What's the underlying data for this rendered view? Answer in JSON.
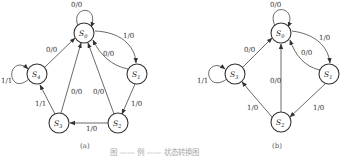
{
  "figure": {
    "caption": "图 ——  例 —— 状态转换图",
    "subfigures": [
      {
        "id": "a",
        "label": "(a)",
        "states": [
          {
            "name": "S",
            "sub": "0",
            "x": 84,
            "y": 33
          },
          {
            "name": "S",
            "sub": "1",
            "x": 137,
            "y": 74
          },
          {
            "name": "S",
            "sub": "2",
            "x": 118,
            "y": 123
          },
          {
            "name": "S",
            "sub": "3",
            "x": 59,
            "y": 123
          },
          {
            "name": "S",
            "sub": "4",
            "x": 37,
            "y": 74
          }
        ],
        "transitions": [
          {
            "from": "S0",
            "to": "S0",
            "label": "0/0"
          },
          {
            "from": "S0",
            "to": "S1",
            "label": "1/0"
          },
          {
            "from": "S1",
            "to": "S0",
            "label": "0/0"
          },
          {
            "from": "S1",
            "to": "S2",
            "label": "1/0"
          },
          {
            "from": "S2",
            "to": "S0",
            "label": "0/0"
          },
          {
            "from": "S2",
            "to": "S3",
            "label": "1/0"
          },
          {
            "from": "S3",
            "to": "S0",
            "label": "0/0"
          },
          {
            "from": "S3",
            "to": "S4",
            "label": "1/1"
          },
          {
            "from": "S4",
            "to": "S0",
            "label": "0/0"
          },
          {
            "from": "S4",
            "to": "S4",
            "label": "1/1"
          }
        ]
      },
      {
        "id": "b",
        "label": "(b)",
        "states": [
          {
            "name": "S",
            "sub": "0",
            "x": 281,
            "y": 33
          },
          {
            "name": "S",
            "sub": "1",
            "x": 329,
            "y": 74
          },
          {
            "name": "S",
            "sub": "2",
            "x": 281,
            "y": 122
          },
          {
            "name": "S",
            "sub": "3",
            "x": 235,
            "y": 74
          }
        ],
        "transitions": [
          {
            "from": "S0",
            "to": "S0",
            "label": "0/0"
          },
          {
            "from": "S0",
            "to": "S1",
            "label": "1/0"
          },
          {
            "from": "S1",
            "to": "S0",
            "label": "0/0"
          },
          {
            "from": "S1",
            "to": "S2",
            "label": "1/0"
          },
          {
            "from": "S2",
            "to": "S0",
            "label": "0/0"
          },
          {
            "from": "S2",
            "to": "S3",
            "label": "1/0"
          },
          {
            "from": "S3",
            "to": "S0",
            "label": "0/0"
          },
          {
            "from": "S3",
            "to": "S3",
            "label": "1/1"
          }
        ]
      }
    ]
  },
  "labels": {
    "a": {
      "s0_self": "0/0",
      "s0_s1": "1/0",
      "s1_s0": "0/0",
      "s1_s2": "1/0",
      "s2_s0": "0/0",
      "s2_s3": "1/0",
      "s3_s0": "0/0",
      "s3_s4": "1/1",
      "s4_s0": "0/0",
      "s4_self": "1/1",
      "caption": "(a)"
    },
    "b": {
      "s0_self": "0/0",
      "s0_s1": "1/0",
      "s1_s0": "0/0",
      "s1_s2": "1/0",
      "s2_s0": "0/0",
      "s2_s3": "1/0",
      "s3_s0": "0/0",
      "s3_self": "1/1",
      "caption": "(b)"
    },
    "state_letter": "S",
    "sub0": "0",
    "sub1": "1",
    "sub2": "2",
    "sub3": "3",
    "sub4": "4"
  }
}
